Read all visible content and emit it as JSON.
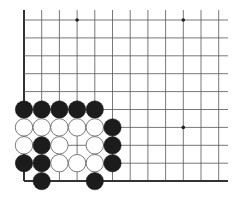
{
  "game": "go",
  "view": "lower-left corner diagram",
  "board": {
    "cols": 12,
    "rows": 10,
    "origin_x": 24,
    "origin_y": 20,
    "step_x": 17.7,
    "step_y": 17.9,
    "line_top_extend": 10,
    "line_right_extend": 228,
    "edges": [
      "left",
      "bottom"
    ]
  },
  "colors": {
    "background": "#ffffff",
    "grid": "#555555",
    "edge": "#333333",
    "black_stone": "#1c1c1c",
    "white_stone_fill": "#ffffff",
    "white_stone_border": "#6a6a6a",
    "star_point": "#222222"
  },
  "star_points": [
    {
      "col": 3,
      "row": 0
    },
    {
      "col": 9,
      "row": 0
    },
    {
      "col": 9,
      "row": 6
    }
  ],
  "stones": [
    {
      "color": "black",
      "col": 0,
      "row": 5
    },
    {
      "color": "black",
      "col": 1,
      "row": 5
    },
    {
      "color": "black",
      "col": 2,
      "row": 5
    },
    {
      "color": "black",
      "col": 3,
      "row": 5
    },
    {
      "color": "black",
      "col": 4,
      "row": 5
    },
    {
      "color": "white",
      "col": 0,
      "row": 6
    },
    {
      "color": "white",
      "col": 1,
      "row": 6
    },
    {
      "color": "white",
      "col": 2,
      "row": 6
    },
    {
      "color": "white",
      "col": 3,
      "row": 6
    },
    {
      "color": "white",
      "col": 4,
      "row": 6
    },
    {
      "color": "black",
      "col": 5,
      "row": 6
    },
    {
      "color": "white",
      "col": 0,
      "row": 7
    },
    {
      "color": "black",
      "col": 1,
      "row": 7
    },
    {
      "color": "white",
      "col": 2,
      "row": 7
    },
    {
      "color": "white",
      "col": 4,
      "row": 7
    },
    {
      "color": "black",
      "col": 5,
      "row": 7
    },
    {
      "color": "black",
      "col": 0,
      "row": 8
    },
    {
      "color": "black",
      "col": 1,
      "row": 8
    },
    {
      "color": "white",
      "col": 2,
      "row": 8
    },
    {
      "color": "white",
      "col": 3,
      "row": 8
    },
    {
      "color": "white",
      "col": 4,
      "row": 8
    },
    {
      "color": "black",
      "col": 5,
      "row": 8
    },
    {
      "color": "black",
      "col": 1,
      "row": 9
    },
    {
      "color": "black",
      "col": 4,
      "row": 9
    }
  ]
}
